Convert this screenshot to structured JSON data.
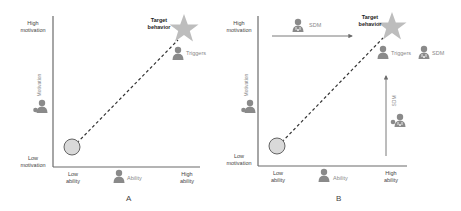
{
  "panels": [
    {
      "id": "A",
      "letter": "A",
      "y_axis": {
        "high": "High\nmotivation",
        "low": "Low\nmotivation",
        "label": "Motivation"
      },
      "x_axis": {
        "low": "Low\nability",
        "high": "High\nability",
        "label": "Ability"
      },
      "target": "Target\nbehavior",
      "triggers_label": "Triggers"
    },
    {
      "id": "B",
      "letter": "B",
      "y_axis": {
        "high": "High\nmotivation",
        "low": "Low\nmotivation",
        "label": "Motivation"
      },
      "x_axis": {
        "low": "Low\nability",
        "high": "High\nability",
        "label": "Ability"
      },
      "target": "Target\nbehavior",
      "triggers_label": "Triggers",
      "sdm_labels": {
        "top": "SDM",
        "right_of_triggers": "SDM",
        "vertical": "SDM"
      }
    }
  ],
  "colors": {
    "axis": "#6b6b6b",
    "star": "#bdbdbd",
    "person": "#8a8a8a",
    "circle_fill": "#d9d9d9",
    "circle_stroke": "#555555",
    "dash": "#333333"
  }
}
